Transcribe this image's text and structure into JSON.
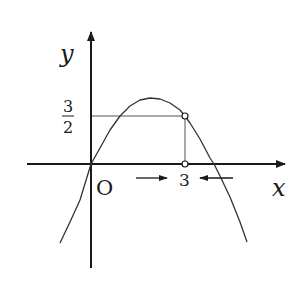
{
  "diagram": {
    "title": "",
    "axes": {
      "x_label": "x",
      "y_label": "y",
      "origin_label": "O"
    },
    "labels": {
      "x_tick": "3",
      "y_tick_numerator": "3",
      "y_tick_denominator": "2"
    },
    "curve": {
      "type": "downward parabola",
      "passes_through": [
        [
          0,
          0
        ],
        [
          3,
          1.5
        ]
      ],
      "polyline": "60,243 70,222 80,200 91,164 100,148 110,130 120,116 130,106 140,100 150,98 160,99 170,103 180,110 185,116 190,123 200,139 210,158 214,164 220,176 230,197 240,222 247,242"
    },
    "points": [
      {
        "name": "point-3-three-halves",
        "x": 3,
        "y": 1.5,
        "style": "open-circle"
      },
      {
        "name": "point-3-on-x-axis",
        "x": 3,
        "y": 0,
        "style": "open-circle"
      }
    ],
    "annotations": [
      {
        "name": "arrow-approach-from-left",
        "direction": "right",
        "meaning": "x approaches 3 from the left"
      },
      {
        "name": "arrow-approach-from-right",
        "direction": "left",
        "meaning": "x approaches 3 from the right"
      }
    ],
    "colors": {
      "ink": "#1a1a1a",
      "guide": "#555555",
      "background": "#ffffff"
    }
  }
}
